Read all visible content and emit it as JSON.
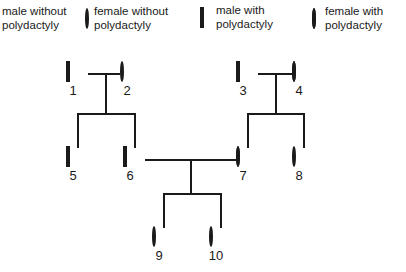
{
  "diagram": {
    "type": "pedigree-chart",
    "trait": "polydactyly",
    "background_color": "#ffffff",
    "line_color": "#1a1a1a",
    "affected_fill": "#111111",
    "unaffected_fill": "#ffffff"
  },
  "legend": {
    "items": [
      {
        "symbol": "open-square",
        "shape": "square",
        "filled": false,
        "label": "male without\npolydactyly",
        "symbol_visible": false
      },
      {
        "symbol": "open-circle",
        "shape": "circle",
        "filled": false,
        "label": "female without\npolydactyly",
        "symbol_visible": true
      },
      {
        "symbol": "filled-square",
        "shape": "square",
        "filled": true,
        "label": "male with\npolydactyly",
        "symbol_visible": true
      },
      {
        "symbol": "filled-circle",
        "shape": "circle",
        "filled": true,
        "label": "female with\npolydactyly",
        "symbol_visible": true
      }
    ]
  },
  "individuals": [
    {
      "id": "1",
      "sex": "male",
      "shape": "square",
      "affected": false,
      "generation": 1,
      "x": 66,
      "y": 63
    },
    {
      "id": "2",
      "sex": "female",
      "shape": "circle",
      "affected": false,
      "generation": 1,
      "x": 120,
      "y": 63
    },
    {
      "id": "3",
      "sex": "male",
      "shape": "square",
      "affected": true,
      "generation": 1,
      "x": 236,
      "y": 63
    },
    {
      "id": "4",
      "sex": "female",
      "shape": "circle",
      "affected": true,
      "generation": 1,
      "x": 292,
      "y": 63
    },
    {
      "id": "5",
      "sex": "male",
      "shape": "square",
      "affected": false,
      "generation": 2,
      "x": 66,
      "y": 148
    },
    {
      "id": "6",
      "sex": "male",
      "shape": "square",
      "affected": false,
      "generation": 2,
      "x": 123,
      "y": 148
    },
    {
      "id": "7",
      "sex": "female",
      "shape": "circle",
      "affected": true,
      "generation": 2,
      "x": 236,
      "y": 148
    },
    {
      "id": "8",
      "sex": "female",
      "shape": "circle",
      "affected": false,
      "generation": 2,
      "x": 292,
      "y": 148
    },
    {
      "id": "9",
      "sex": "female",
      "shape": "circle",
      "affected": false,
      "generation": 3,
      "x": 152,
      "y": 228
    },
    {
      "id": "10",
      "sex": "female",
      "shape": "circle",
      "affected": false,
      "generation": 3,
      "x": 209,
      "y": 228
    }
  ],
  "matings": [
    {
      "partners": [
        "1",
        "2"
      ],
      "children": [
        "5",
        "6"
      ]
    },
    {
      "partners": [
        "3",
        "4"
      ],
      "children": [
        "7",
        "8"
      ]
    },
    {
      "partners": [
        "6",
        "7"
      ],
      "children": [
        "9",
        "10"
      ]
    }
  ]
}
